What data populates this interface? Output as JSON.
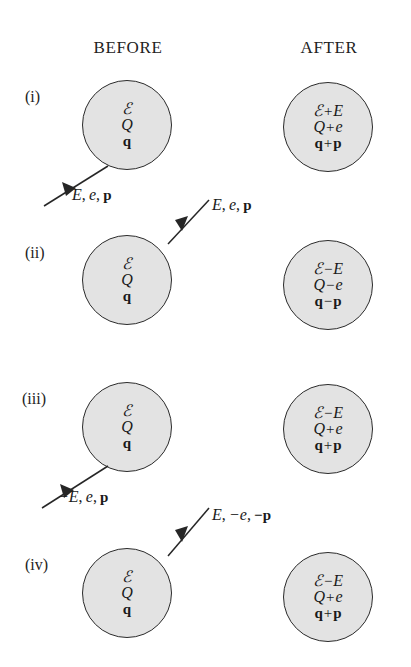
{
  "figure": {
    "background_color": "#ffffff",
    "blob_fill_color": "#e3e3e3",
    "blob_stroke_color": "#2b2b2b",
    "ink_color": "#1a1a1a"
  },
  "headers": {
    "before": "BEFORE",
    "after": "AFTER"
  },
  "rows": [
    {
      "label": "(i)",
      "before": {
        "line1": {
          "sym": "ℰ"
        },
        "line2": {
          "sym": "Q"
        },
        "line3": {
          "sym": "q"
        }
      },
      "after": {
        "line1": {
          "lhs": "ℰ",
          "op": "+",
          "rhs": "E"
        },
        "line2": {
          "lhs": "Q",
          "op": "+",
          "rhs": "e"
        },
        "line3": {
          "lhs": "q",
          "op": "+",
          "rhs": "p"
        }
      },
      "arrow": {
        "label_parts": {
          "energy": "E",
          "charge": "e",
          "momentum": "p"
        },
        "label_text": "E, e, p",
        "direction": "up-right",
        "description": "incoming particle arrow from lower-left into blob"
      }
    },
    {
      "label": "(ii)",
      "before": {
        "line1": {
          "sym": "ℰ"
        },
        "line2": {
          "sym": "Q"
        },
        "line3": {
          "sym": "q"
        }
      },
      "after": {
        "line1": {
          "lhs": "ℰ",
          "op": "−",
          "rhs": "E"
        },
        "line2": {
          "lhs": "Q",
          "op": "−",
          "rhs": "e"
        },
        "line3": {
          "lhs": "q",
          "op": "−",
          "rhs": "p"
        }
      },
      "arrow": {
        "label_parts": {
          "energy": "E",
          "charge": "e",
          "momentum": "p"
        },
        "label_text": "E, e, p",
        "direction": "down-left",
        "description": "outgoing particle arrow from upper-right into blob"
      }
    },
    {
      "label": "(iii)",
      "before": {
        "line1": {
          "sym": "ℰ"
        },
        "line2": {
          "sym": "Q"
        },
        "line3": {
          "sym": "q"
        }
      },
      "after": {
        "line1": {
          "lhs": "ℰ",
          "op": "−",
          "rhs": "E"
        },
        "line2": {
          "lhs": "Q",
          "op": "+",
          "rhs": "e"
        },
        "line3": {
          "lhs": "q",
          "op": "+",
          "rhs": "p"
        }
      },
      "arrow": {
        "label_parts": {
          "energy": "−E",
          "charge": "e",
          "momentum": "p"
        },
        "label_text": "−E, e, p",
        "direction": "up-right",
        "description": "negative-energy particle arrow from lower-left into blob"
      }
    },
    {
      "label": "(iv)",
      "before": {
        "line1": {
          "sym": "ℰ"
        },
        "line2": {
          "sym": "Q"
        },
        "line3": {
          "sym": "q"
        }
      },
      "after": {
        "line1": {
          "lhs": "ℰ",
          "op": "−",
          "rhs": "E"
        },
        "line2": {
          "lhs": "Q",
          "op": "+",
          "rhs": "e"
        },
        "line3": {
          "lhs": "q",
          "op": "+",
          "rhs": "p"
        }
      },
      "arrow": {
        "label_parts": {
          "energy": "E",
          "charge": "−e",
          "momentum": "−p"
        },
        "label_text": "E, −e, −p",
        "direction": "down-left",
        "description": "antiparticle arrow from upper-right into blob"
      }
    }
  ],
  "separators": {
    "comma": ",",
    "plus": "+",
    "minus": "−"
  }
}
